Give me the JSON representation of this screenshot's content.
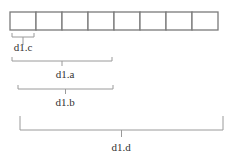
{
  "diagram": {
    "array": {
      "cell_count": 8,
      "x": 10,
      "y": 12,
      "cell_width": 26,
      "cell_height": 18,
      "stroke_color": "#7a7a7a"
    },
    "braces": [
      {
        "id": "d1c",
        "label": "d1.c",
        "x1": 12,
        "x2": 34,
        "y": 33,
        "depth": 4,
        "stem": 8,
        "label_x": 23,
        "label_y": 51
      },
      {
        "id": "d1a",
        "label": "d1.a",
        "x1": 12,
        "x2": 112,
        "y": 57,
        "depth": 4,
        "stem": 5,
        "label_x": 65,
        "label_y": 78
      },
      {
        "id": "d1b",
        "label": "d1.b",
        "x1": 18,
        "x2": 113,
        "y": 85,
        "depth": 4,
        "stem": 5,
        "label_x": 65,
        "label_y": 106
      },
      {
        "id": "d1d",
        "label": "d1.d",
        "x1": 20,
        "x2": 223,
        "y": 116,
        "depth": 14,
        "stem": 7,
        "label_x": 121,
        "label_y": 151
      }
    ],
    "brace_color": "#9a9a9a",
    "label_color": "#333333"
  }
}
